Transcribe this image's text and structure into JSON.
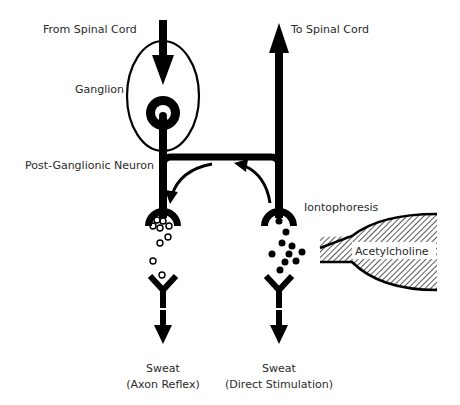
{
  "diagram": {
    "labels": {
      "from_spinal_cord": "From Spinal Cord",
      "to_spinal_cord": "To Spinal Cord",
      "ganglion": "Ganglion",
      "post_ganglionic_neuron": "Post-Ganglionic Neuron",
      "iontophoresis": "Iontophoresis",
      "acetylcholine": "Acetylcholine",
      "sweat_left_line1": "Sweat",
      "sweat_left_line2": "(Axon Reflex)",
      "sweat_right_line1": "Sweat",
      "sweat_right_line2": "(Direct Stimulation)"
    },
    "colors": {
      "ink": "#000000",
      "text": "#2a2a2a",
      "background": "#ffffff"
    }
  }
}
